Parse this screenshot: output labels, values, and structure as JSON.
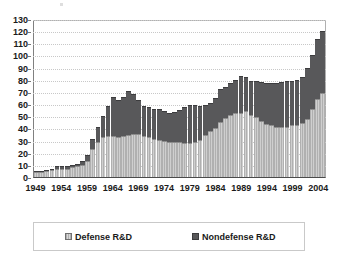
{
  "chart_data": {
    "type": "bar",
    "subtype": "stacked-column",
    "title": "",
    "subtitle": "",
    "xlabel": "",
    "ylabel": "",
    "ylim": [
      0,
      130
    ],
    "ytick_step": 10,
    "ytick_labels": [
      "0",
      "10",
      "20",
      "30",
      "40",
      "50",
      "60",
      "70",
      "80",
      "90",
      "100",
      "110",
      "120",
      "130"
    ],
    "xtick_labels": [
      "1949",
      "1954",
      "1959",
      "1964",
      "1969",
      "1974",
      "1979",
      "1984",
      "1989",
      "1994",
      "1999",
      "2004"
    ],
    "xtick_step": 5,
    "grid": true,
    "grid_style": "dotted-horizontal",
    "legend_position": "bottom",
    "categories": [
      "1949",
      "1950",
      "1951",
      "1952",
      "1953",
      "1954",
      "1955",
      "1956",
      "1957",
      "1958",
      "1959",
      "1960",
      "1961",
      "1962",
      "1963",
      "1964",
      "1965",
      "1966",
      "1967",
      "1968",
      "1969",
      "1970",
      "1971",
      "1972",
      "1973",
      "1974",
      "1975",
      "1976",
      "1977",
      "1978",
      "1979",
      "1980",
      "1981",
      "1982",
      "1983",
      "1984",
      "1985",
      "1986",
      "1987",
      "1988",
      "1989",
      "1990",
      "1991",
      "1992",
      "1993",
      "1994",
      "1995",
      "1996",
      "1997",
      "1998",
      "1999",
      "2000",
      "2001",
      "2002",
      "2003",
      "2004",
      "2005"
    ],
    "series": [
      {
        "name": "Defense R&D",
        "color": "#b5b5b5",
        "values": [
          4,
          4,
          5,
          6,
          7,
          7,
          7,
          8,
          9,
          10,
          13,
          23,
          29,
          33,
          34,
          34,
          33,
          34,
          35,
          36,
          36,
          34,
          33,
          32,
          31,
          30,
          29,
          29,
          29,
          28,
          28,
          29,
          31,
          35,
          38,
          41,
          46,
          49,
          52,
          53,
          53,
          55,
          52,
          50,
          47,
          44,
          43,
          42,
          42,
          42,
          43,
          43,
          45,
          48,
          57,
          65,
          70
        ]
      },
      {
        "name": "Nondefense R&D",
        "color": "#58585a",
        "values": [
          1,
          1,
          1,
          1,
          2,
          2,
          2,
          2,
          2,
          3,
          5,
          9,
          13,
          18,
          25,
          33,
          31,
          33,
          37,
          33,
          28,
          25,
          25,
          25,
          26,
          25,
          24,
          25,
          27,
          30,
          32,
          31,
          28,
          25,
          24,
          25,
          27,
          26,
          26,
          28,
          31,
          28,
          28,
          30,
          32,
          34,
          35,
          36,
          37,
          38,
          37,
          38,
          38,
          43,
          45,
          50,
          52
        ]
      }
    ],
    "totals": [
      5,
      5,
      6,
      7,
      9,
      9,
      9,
      10,
      11,
      13,
      18,
      32,
      42,
      51,
      59,
      67,
      64,
      67,
      72,
      69,
      64,
      59,
      58,
      57,
      57,
      55,
      53,
      54,
      56,
      58,
      60,
      60,
      59,
      60,
      62,
      66,
      73,
      75,
      78,
      81,
      84,
      83,
      80,
      80,
      79,
      78,
      78,
      78,
      79,
      80,
      80,
      81,
      83,
      91,
      102,
      115,
      122
    ]
  },
  "legend": {
    "entries": [
      {
        "label": "Defense R&D",
        "swatch": "light-striped-swatch"
      },
      {
        "label": "Nondefense R&D",
        "swatch": "dark-solid-swatch"
      }
    ]
  }
}
